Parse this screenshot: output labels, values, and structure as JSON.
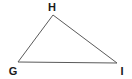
{
  "diagram": {
    "type": "triangle",
    "stroke_color": "#5a5a5a",
    "label_color": "#1a1a1a",
    "vertices": [
      {
        "label": "H",
        "x": 53,
        "y": 15,
        "label_x": 52,
        "label_y": 11
      },
      {
        "label": "G",
        "x": 18,
        "y": 62,
        "label_x": 13,
        "label_y": 75
      },
      {
        "label": "I",
        "x": 117,
        "y": 63,
        "label_x": 122,
        "label_y": 75
      }
    ],
    "edges": [
      {
        "from": "H",
        "to": "G"
      },
      {
        "from": "G",
        "to": "I"
      },
      {
        "from": "I",
        "to": "H"
      }
    ]
  }
}
